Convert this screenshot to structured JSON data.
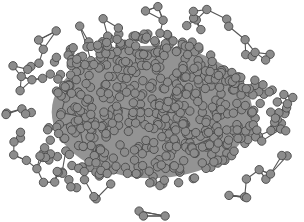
{
  "figure": {
    "type": "network-graph",
    "layout": "force-directed",
    "width": 304,
    "height": 222,
    "background": "#ffffff"
  },
  "style": {
    "node_fill": "#8c8c8c",
    "node_stroke": "#4a4a4a",
    "node_radius": 4.2,
    "edge_color": "#555555",
    "edge_width": 1.1,
    "core_shadow": "#3a3a3a"
  },
  "generation": {
    "seed": 7,
    "core_nodes": 560,
    "periphery_nodes": 70,
    "center": [
      152,
      112
    ],
    "core_radii": [
      118,
      78
    ],
    "periphery_radii": [
      140,
      100
    ],
    "edges_per_periphery_node": 2
  }
}
